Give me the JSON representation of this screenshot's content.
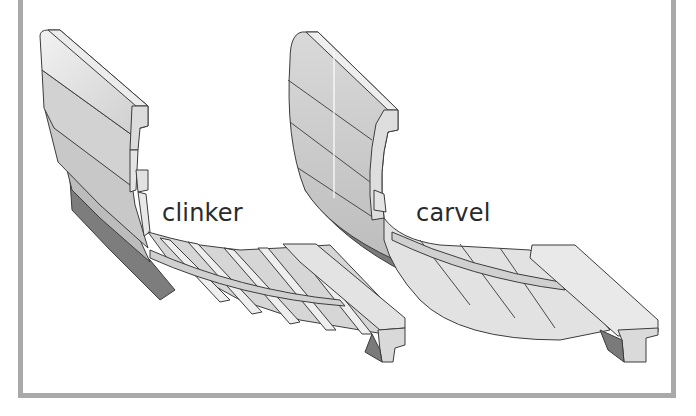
{
  "diagram": {
    "type": "illustration",
    "panels": [
      {
        "id": "clinker",
        "label": "clinker",
        "description": "overlapping planks on curved hull section with frame"
      },
      {
        "id": "carvel",
        "label": "carvel",
        "description": "flush edge-to-edge planks on curved hull section with frame"
      }
    ]
  },
  "colors": {
    "frame_border": "#a9a9a9",
    "plank_light": "#e6e6e6",
    "plank_mid": "#cfcfcf",
    "plank_dark": "#8a8a8a",
    "outline": "#3c3c3c",
    "text": "#2a2a2a"
  }
}
